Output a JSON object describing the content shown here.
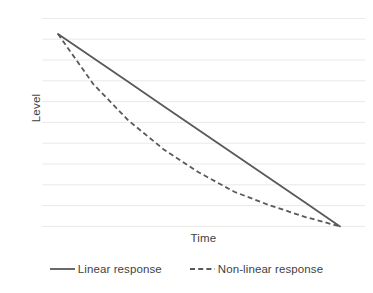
{
  "chart_data": {
    "type": "line",
    "title": "",
    "subtitle": "",
    "xlabel": "Time",
    "ylabel": "Level",
    "xlim": [
      0,
      100
    ],
    "ylim": [
      0,
      100
    ],
    "grid": true,
    "gridlines_y": [
      0,
      10,
      20,
      30,
      40,
      50,
      60,
      70,
      80,
      90,
      100
    ],
    "axis_tick_labels": {
      "x": [],
      "y": []
    },
    "legend_position": "bottom",
    "series": [
      {
        "name": "Linear response",
        "style": "solid",
        "color": "#595959",
        "x": [
          0,
          12.5,
          25,
          37.5,
          50,
          62.5,
          75,
          87.5,
          100
        ],
        "values": [
          100,
          87.5,
          75,
          62.5,
          50,
          37.5,
          25,
          12.5,
          0
        ]
      },
      {
        "name": "Non-linear response",
        "style": "dashed",
        "color": "#595959",
        "x": [
          0,
          12.5,
          25,
          37.5,
          50,
          62.5,
          75,
          87.5,
          100
        ],
        "values": [
          100,
          74,
          55,
          40,
          28,
          18,
          11,
          5,
          0
        ]
      }
    ]
  },
  "legend": {
    "items": [
      {
        "label": "Linear response",
        "style": "solid",
        "color": "#595959"
      },
      {
        "label": "Non-linear response",
        "style": "dashed",
        "color": "#595959"
      }
    ]
  },
  "axes": {
    "x_title": "Time",
    "y_title": "Level"
  },
  "style": {
    "background": "#ffffff",
    "gridline_color": "#e9e9e9",
    "line_color": "#595959",
    "text_color": "#3f3f3f"
  }
}
